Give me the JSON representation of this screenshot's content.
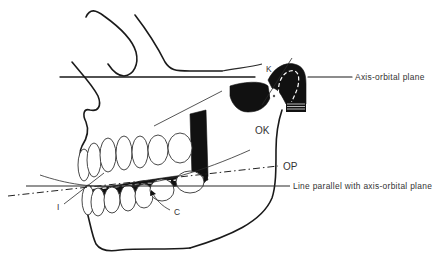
{
  "figure": {
    "colors": {
      "ink": "#111111",
      "label": "#333333",
      "background": "#ffffff"
    }
  },
  "labels": {
    "K": "K",
    "axis_orbital_plane": "Axis-orbital plane",
    "OK": "OK",
    "OP": "OP",
    "line_parallel": "Line parallel with axis-orbital plane",
    "I": "I",
    "C": "C"
  },
  "lines": [
    {
      "name": "axis-orbital-plane",
      "style": "solid"
    },
    {
      "name": "occlusal-plane-OP",
      "style": "dash-dot"
    },
    {
      "name": "line-parallel-with-axis-orbital-plane",
      "style": "solid"
    },
    {
      "name": "condyle-line-K",
      "style": "solid"
    },
    {
      "name": "occlusal-curve-OK",
      "style": "solid"
    },
    {
      "name": "incisal-line-I",
      "style": "solid"
    }
  ]
}
